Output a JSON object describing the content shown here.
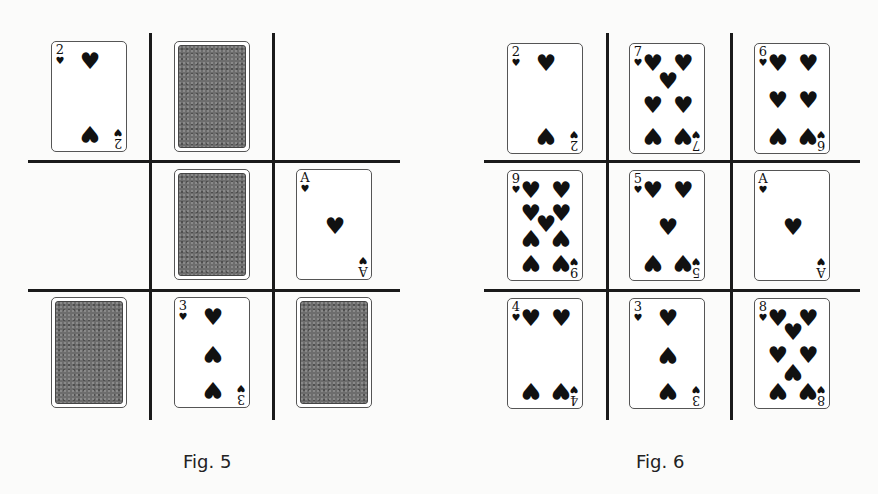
{
  "figures": [
    {
      "id": "fig5",
      "caption": "Fig. 5",
      "grid": {
        "v_lines_x": [
          150,
          273
        ],
        "h_lines_y": [
          161,
          290
        ],
        "x_range": [
          28,
          400
        ],
        "y_range": [
          33,
          420
        ]
      },
      "cells": [
        {
          "row": 0,
          "col": 0,
          "type": "face-up",
          "rank": "2",
          "suit": "hearts",
          "x": 51,
          "y": 41
        },
        {
          "row": 0,
          "col": 1,
          "type": "face-down",
          "x": 174,
          "y": 41
        },
        {
          "row": 0,
          "col": 2,
          "type": "empty"
        },
        {
          "row": 1,
          "col": 0,
          "type": "empty"
        },
        {
          "row": 1,
          "col": 1,
          "type": "face-down",
          "x": 174,
          "y": 169
        },
        {
          "row": 1,
          "col": 2,
          "type": "face-up",
          "rank": "A",
          "suit": "hearts",
          "x": 296,
          "y": 169
        },
        {
          "row": 2,
          "col": 0,
          "type": "face-down",
          "x": 51,
          "y": 297
        },
        {
          "row": 2,
          "col": 1,
          "type": "face-up",
          "rank": "3",
          "suit": "hearts",
          "x": 174,
          "y": 297
        },
        {
          "row": 2,
          "col": 2,
          "type": "face-down",
          "x": 296,
          "y": 297
        }
      ]
    },
    {
      "id": "fig6",
      "caption": "Fig. 6",
      "grid": {
        "v_lines_x": [
          607,
          731
        ],
        "h_lines_y": [
          161,
          290
        ],
        "x_range": [
          484,
          860
        ],
        "y_range": [
          33,
          420
        ]
      },
      "cells": [
        {
          "row": 0,
          "col": 0,
          "type": "face-up",
          "rank": "2",
          "suit": "hearts",
          "x": 507,
          "y": 43
        },
        {
          "row": 0,
          "col": 1,
          "type": "face-up",
          "rank": "7",
          "suit": "hearts",
          "x": 629,
          "y": 43
        },
        {
          "row": 0,
          "col": 2,
          "type": "face-up",
          "rank": "6",
          "suit": "hearts",
          "x": 754,
          "y": 43
        },
        {
          "row": 1,
          "col": 0,
          "type": "face-up",
          "rank": "9",
          "suit": "hearts",
          "x": 507,
          "y": 170
        },
        {
          "row": 1,
          "col": 1,
          "type": "face-up",
          "rank": "5",
          "suit": "hearts",
          "x": 629,
          "y": 170
        },
        {
          "row": 1,
          "col": 2,
          "type": "face-up",
          "rank": "A",
          "suit": "hearts",
          "x": 754,
          "y": 170
        },
        {
          "row": 2,
          "col": 0,
          "type": "face-up",
          "rank": "4",
          "suit": "hearts",
          "x": 507,
          "y": 298
        },
        {
          "row": 2,
          "col": 1,
          "type": "face-up",
          "rank": "3",
          "suit": "hearts",
          "x": 629,
          "y": 298
        },
        {
          "row": 2,
          "col": 2,
          "type": "face-up",
          "rank": "8",
          "suit": "hearts",
          "x": 754,
          "y": 298
        }
      ]
    }
  ],
  "suit_glyph": "♥",
  "colors": {
    "ink": "#1a1a1a",
    "card_back": "#6d6d6d",
    "background": "#fbfbfa"
  }
}
